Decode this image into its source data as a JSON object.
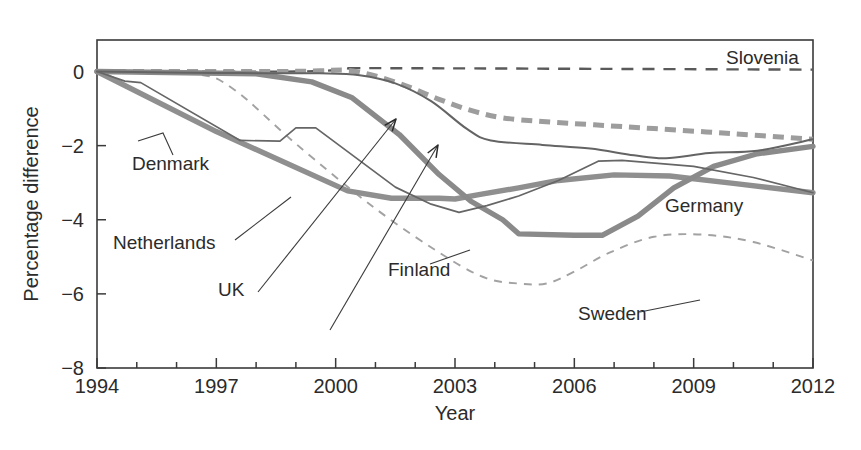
{
  "chart_data": {
    "type": "line",
    "title": "",
    "xlabel": "Year",
    "ylabel": "Percentage difference",
    "xlim": [
      1994,
      2012
    ],
    "ylim": [
      -8,
      0.85
    ],
    "grid": false,
    "legend_position": "inline-annotations",
    "x_ticks_major": [
      1994,
      1997,
      2000,
      2003,
      2006,
      2009,
      2012
    ],
    "x_ticks_major_labels": [
      "1994",
      "1997",
      "2000",
      "2003",
      "2006",
      "2009",
      "2012"
    ],
    "x_ticks_minor": [
      1995,
      1996,
      1998,
      1999,
      2001,
      2002,
      2004,
      2005,
      2007,
      2008,
      2010,
      2011
    ],
    "y_ticks": [
      0,
      -2,
      -4,
      -6,
      -8
    ],
    "y_tick_labels": [
      "0",
      "−2",
      "−4",
      "−6",
      "−8"
    ],
    "x": [
      1994,
      1995,
      1996,
      1997,
      1998,
      1999,
      2000,
      2001,
      2002,
      2003,
      2004,
      2005,
      2006,
      2007,
      2008,
      2009,
      2010,
      2011,
      2012
    ],
    "series": [
      {
        "name": "Slovenia",
        "style": "dashed",
        "color": "#5a5a5a",
        "width": 2.4,
        "values": [
          0.0,
          0.0,
          0.0,
          0.0,
          0.0,
          0.0,
          0.05,
          0.08,
          0.06,
          0.05,
          0.05,
          0.05,
          0.05,
          0.05,
          0.05,
          0.05,
          0.05,
          0.05,
          0.05
        ]
      },
      {
        "name": "UK",
        "style": "dashed",
        "color": "#9a9a9a",
        "width": 4.6,
        "values": [
          0.0,
          0.0,
          0.0,
          0.0,
          0.0,
          0.0,
          0.0,
          -0.1,
          -0.35,
          -0.68,
          -1.0,
          -1.22,
          -1.33,
          -1.43,
          -1.5,
          -1.58,
          -1.66,
          -1.74,
          -1.82
        ]
      },
      {
        "name": "Germany",
        "style": "solid",
        "color": "#6a6a6a",
        "width": 2.0,
        "values": [
          0.0,
          0.0,
          -0.02,
          -0.04,
          -0.05,
          -0.05,
          -0.06,
          -0.18,
          -0.55,
          -1.1,
          -1.82,
          -1.95,
          -2.05,
          -2.2,
          -2.32,
          -2.22,
          -2.18,
          -2.0,
          -1.82
        ]
      },
      {
        "name": "Denmark",
        "style": "solid",
        "color": "#8c8c8c",
        "width": 5.2,
        "values": [
          0.0,
          -0.55,
          -1.1,
          -1.6,
          -2.1,
          -2.62,
          -3.18,
          -3.4,
          -3.42,
          -3.4,
          -3.34,
          -3.1,
          -2.9,
          -2.8,
          -2.8,
          -2.86,
          -3.02,
          -3.18,
          -3.26
        ]
      },
      {
        "name": "Netherlands",
        "style": "solid",
        "color": "#6a6a6a",
        "width": 1.6,
        "values": [
          0.0,
          -0.28,
          -0.3,
          -1.08,
          -1.82,
          -1.86,
          -1.52,
          -2.52,
          -3.4,
          -3.68,
          -3.78,
          -3.6,
          -3.25,
          -2.62,
          -2.4,
          -2.52,
          -2.72,
          -2.96,
          -3.26
        ]
      },
      {
        "name": "Finland",
        "style": "solid",
        "color": "#8c8c8c",
        "width": 5.2,
        "values": [
          0.0,
          0.0,
          0.0,
          -0.02,
          -0.08,
          -0.2,
          -0.55,
          -1.3,
          -2.28,
          -3.2,
          -3.92,
          -4.38,
          -4.4,
          -4.38,
          -3.5,
          -2.7,
          -2.3,
          -2.12,
          -2.0
        ]
      },
      {
        "name": "Sweden",
        "style": "dashed",
        "color": "#a0a0a0",
        "width": 1.8,
        "values": [
          0.0,
          0.0,
          -0.02,
          -0.2,
          -0.95,
          -1.9,
          -2.85,
          -3.7,
          -4.42,
          -5.1,
          -5.62,
          -5.7,
          -5.3,
          -4.72,
          -4.42,
          -4.38,
          -4.52,
          -4.8,
          -5.12
        ]
      }
    ],
    "series_paths": {
      "slovenia": [
        [
          1994,
          0.0
        ],
        [
          1999,
          0.0
        ],
        [
          2000.4,
          0.07
        ],
        [
          2001.2,
          0.09
        ],
        [
          2012,
          0.05
        ]
      ],
      "uk_dashed": [
        [
          1994,
          0.0
        ],
        [
          1998.4,
          0.0
        ],
        [
          1999.6,
          0.02
        ],
        [
          2000.3,
          0.03
        ],
        [
          2001.0,
          -0.12
        ],
        [
          2001.8,
          -0.4
        ],
        [
          2002.6,
          -0.75
        ],
        [
          2003.4,
          -1.05
        ],
        [
          2004.2,
          -1.25
        ],
        [
          2005.2,
          -1.35
        ],
        [
          2006.5,
          -1.44
        ],
        [
          2008,
          -1.54
        ],
        [
          2010,
          -1.68
        ],
        [
          2012,
          -1.83
        ]
      ],
      "germany": [
        [
          1994,
          0.0
        ],
        [
          1997,
          -0.04
        ],
        [
          1999.6,
          -0.05
        ],
        [
          2000.6,
          -0.1
        ],
        [
          2001.5,
          -0.32
        ],
        [
          2002.4,
          -0.8
        ],
        [
          2003.3,
          -1.55
        ],
        [
          2003.9,
          -1.86
        ],
        [
          2005.2,
          -1.98
        ],
        [
          2006.4,
          -2.08
        ],
        [
          2007.5,
          -2.26
        ],
        [
          2008.3,
          -2.34
        ],
        [
          2009.4,
          -2.2
        ],
        [
          2010.6,
          -2.14
        ],
        [
          2012,
          -1.83
        ]
      ],
      "denmark": [
        [
          1994,
          0.0
        ],
        [
          1997,
          -1.62
        ],
        [
          2000.3,
          -3.22
        ],
        [
          2001.4,
          -3.42
        ],
        [
          2002.6,
          -3.42
        ],
        [
          2003.0,
          -3.44
        ],
        [
          2003.6,
          -3.32
        ],
        [
          2004.6,
          -3.14
        ],
        [
          2005.6,
          -2.94
        ],
        [
          2007,
          -2.79
        ],
        [
          2008.4,
          -2.82
        ],
        [
          2010,
          -3.02
        ],
        [
          2012,
          -3.27
        ]
      ],
      "netherlands": [
        [
          1994,
          0.0
        ],
        [
          1994.7,
          -0.26
        ],
        [
          1995.1,
          -0.3
        ],
        [
          1997.6,
          -1.86
        ],
        [
          1998.6,
          -1.88
        ],
        [
          1999.0,
          -1.52
        ],
        [
          1999.5,
          -1.52
        ],
        [
          2001.5,
          -3.12
        ],
        [
          2002.4,
          -3.58
        ],
        [
          2003.1,
          -3.8
        ],
        [
          2003.8,
          -3.62
        ],
        [
          2004.6,
          -3.36
        ],
        [
          2005.6,
          -2.94
        ],
        [
          2006.6,
          -2.42
        ],
        [
          2007.2,
          -2.4
        ],
        [
          2009,
          -2.56
        ],
        [
          2010.5,
          -2.86
        ],
        [
          2012,
          -3.27
        ]
      ],
      "finland": [
        [
          1994,
          0.0
        ],
        [
          1998,
          -0.06
        ],
        [
          1999.4,
          -0.28
        ],
        [
          2000.4,
          -0.7
        ],
        [
          2001.6,
          -1.7
        ],
        [
          2002.6,
          -2.78
        ],
        [
          2003.4,
          -3.5
        ],
        [
          2004.2,
          -4.0
        ],
        [
          2004.6,
          -4.38
        ],
        [
          2006.0,
          -4.42
        ],
        [
          2006.7,
          -4.42
        ],
        [
          2007.6,
          -3.9
        ],
        [
          2008.5,
          -3.14
        ],
        [
          2009.5,
          -2.56
        ],
        [
          2010.6,
          -2.22
        ],
        [
          2012,
          -2.02
        ]
      ],
      "sweden": [
        [
          1994,
          0.0
        ],
        [
          1996.4,
          -0.06
        ],
        [
          1997.4,
          -0.45
        ],
        [
          1999,
          -1.95
        ],
        [
          2001,
          -3.7
        ],
        [
          2002.8,
          -5.02
        ],
        [
          2003.8,
          -5.58
        ],
        [
          2004.6,
          -5.72
        ],
        [
          2005.3,
          -5.72
        ],
        [
          2006.0,
          -5.4
        ],
        [
          2006.9,
          -4.88
        ],
        [
          2008.0,
          -4.46
        ],
        [
          2009.2,
          -4.4
        ],
        [
          2010.5,
          -4.6
        ],
        [
          2012,
          -5.1
        ]
      ]
    },
    "annotations": [
      {
        "text": "Slovenia",
        "x": 726,
        "y": 64
      },
      {
        "text": "Denmark",
        "x": 132,
        "y": 170
      },
      {
        "text": "Netherlands",
        "x": 113,
        "y": 249
      },
      {
        "text": "UK",
        "x": 218,
        "y": 296
      },
      {
        "text": "Finland",
        "x": 388,
        "y": 276
      },
      {
        "text": "Germany",
        "x": 665,
        "y": 212
      },
      {
        "text": "Sweden",
        "x": 578,
        "y": 320
      }
    ]
  }
}
